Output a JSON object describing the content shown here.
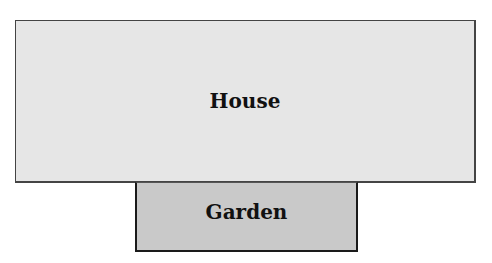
{
  "diagram": {
    "house": {
      "label": "House",
      "fill": "#e6e6e6"
    },
    "garden": {
      "label": "Garden",
      "fill": "#c9c9c9"
    }
  }
}
